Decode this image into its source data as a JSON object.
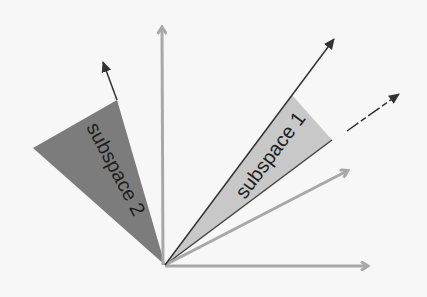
{
  "diagram": {
    "title": "",
    "colors": {
      "background": "#f7f7f7",
      "subspace_1_fill": "#c8c8c8",
      "subspace_2_fill": "#7c7c7c",
      "dark_vector": "#333333",
      "light_vector": "#a8a8a8",
      "label": "#1e1e1e"
    },
    "origin": [
      165,
      265
    ],
    "regions": [
      {
        "id": "subspace-2",
        "label": "subspace 2",
        "points": [
          [
            165,
            265
          ],
          [
            117,
            100
          ],
          [
            33,
            148
          ]
        ]
      },
      {
        "id": "subspace-1",
        "label": "subspace 1",
        "points": [
          [
            165,
            265
          ],
          [
            292,
            95
          ],
          [
            332,
            140
          ]
        ]
      }
    ],
    "vectors": [
      {
        "id": "vertical-axis",
        "style": "light",
        "to": [
          162,
          25
        ]
      },
      {
        "id": "horizontal-axis",
        "style": "light",
        "to": [
          370,
          266
        ]
      },
      {
        "id": "light-diagonal",
        "style": "light",
        "to": [
          350,
          170
        ]
      },
      {
        "id": "subspace-2-vector",
        "style": "dark",
        "from": [
          117,
          100
        ],
        "to": [
          102,
          60
        ]
      },
      {
        "id": "subspace-1-vector-upper",
        "style": "dark",
        "from": [
          165,
          265
        ],
        "to": [
          335,
          37
        ]
      },
      {
        "id": "subspace-1-vector-lower",
        "style": "dark-dashed",
        "from": [
          347,
          130
        ],
        "to": [
          400,
          93
        ]
      }
    ]
  }
}
